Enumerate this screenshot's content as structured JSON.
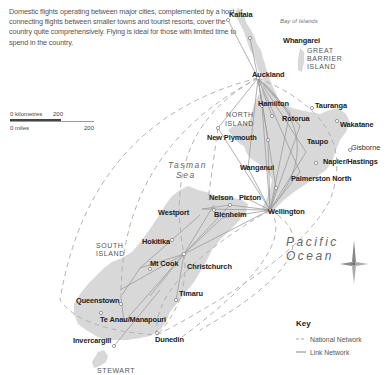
{
  "intro": {
    "text": "Domestic flights operating between major cities, complemented by a host of connecting flights between smaller towns and tourist resorts, cover the country quite comprehensively. Flying is ideal for those with limited time to spend in the country."
  },
  "scale": {
    "km_label": "0 kilometres",
    "km_value": "200",
    "mi_label": "0 miles",
    "mi_value": "200"
  },
  "regions": {
    "north_island_1": "NORTH",
    "north_island_2": "ISLAND",
    "south_island_1": "SOUTH",
    "south_island_2": "ISLAND",
    "great_barrier_1": "GREAT",
    "great_barrier_2": "BARRIER",
    "great_barrier_3": "ISLAND",
    "stewart": "STEWART",
    "bay_of_islands": "Bay of Islands",
    "tasman_1": "Tasman",
    "tasman_2": "Sea",
    "pacific_1": "Pacific",
    "pacific_2": "Ocean"
  },
  "cities": {
    "kaitaia": "Kaitaia",
    "whangarei": "Whangarei",
    "auckland": "Auckland",
    "hamilton": "Hamilton",
    "tauranga": "Tauranga",
    "rotorua": "Rotorua",
    "wakatane": "Wakatane",
    "new_plymouth": "New Plymouth",
    "taupo": "Taupo",
    "gisborne": "Gisborne",
    "napier": "Napier/Hastings",
    "wanganui": "Wanganui",
    "palmerston": "Palmerston North",
    "nelson": "Nelson",
    "picton": "Picton",
    "westport": "Westport",
    "blenheim": "Blenheim",
    "wellington": "Wellington",
    "hokitika": "Hokitika",
    "mt_cook": "Mt Cook",
    "christchurch": "Christchurch",
    "timaru": "Timaru",
    "queenstown": "Queenstown",
    "te_anau": "Te Anau/Manapouri",
    "invercargill": "Invercargill",
    "dunedin": "Dunedin"
  },
  "key": {
    "title": "Key",
    "national": "National Network",
    "link": "Link Network"
  },
  "colors": {
    "land": "#d9d9d9",
    "link_line": "#9a9a9a",
    "national_line": "#b5b5b5",
    "text": "#222222"
  }
}
